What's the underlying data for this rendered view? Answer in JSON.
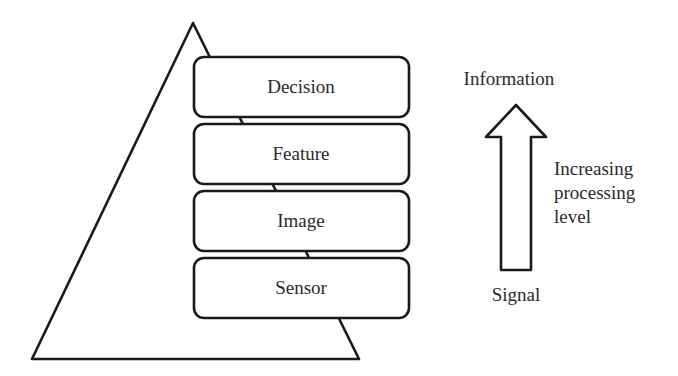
{
  "diagram": {
    "type": "pyramid-with-layers",
    "pyramid": {
      "layers": [
        {
          "label": "Decision"
        },
        {
          "label": "Feature"
        },
        {
          "label": "Image"
        },
        {
          "label": "Sensor"
        }
      ]
    },
    "arrow": {
      "direction": "up",
      "top_label": "Information",
      "bottom_label": "Signal",
      "side_label_lines": [
        "Increasing",
        "processing",
        "level"
      ]
    },
    "colors": {
      "stroke": "#1a1a1a",
      "fill": "#ffffff",
      "text": "#2a2a2a"
    }
  }
}
